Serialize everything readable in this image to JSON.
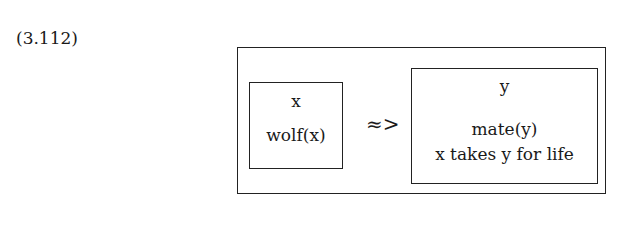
{
  "equation_number": "(3.112)",
  "drs": {
    "antecedent": {
      "referents": "x",
      "conditions": [
        "wolf(x)"
      ]
    },
    "connective": "≈>",
    "consequent": {
      "referents": "y",
      "conditions": [
        "mate(y)",
        "x takes y for life"
      ]
    }
  }
}
